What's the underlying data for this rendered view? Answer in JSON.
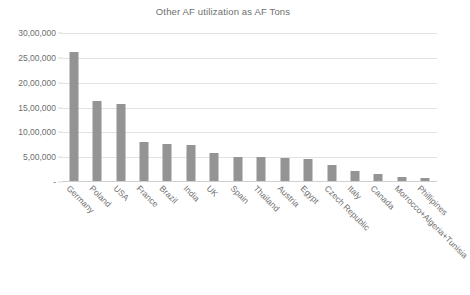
{
  "chart_data": {
    "type": "bar",
    "title": "Other AF utilization as AF Tons",
    "xlabel": "",
    "ylabel": "",
    "ylim": [
      0,
      3000000
    ],
    "grid": true,
    "legend": "none",
    "y_tick_labels": [
      "30,00,000",
      "25,00,000",
      "20,00,000",
      "15,00,000",
      "10,00,000",
      "5,00,000",
      "-"
    ],
    "y_tick_values": [
      3000000,
      2500000,
      2000000,
      1500000,
      1000000,
      500000,
      0
    ],
    "bar_color": "#949494",
    "categories": [
      "Germany",
      "Poland",
      "USA",
      "France",
      "Brazil",
      "India",
      "UK",
      "Spain",
      "Thailand",
      "Austria",
      "Egypt",
      "Czech Republic",
      "Italy",
      "Canada",
      "Morrocco+Algeria+Tunisia",
      "Phillipines"
    ],
    "values": [
      2620000,
      1630000,
      1580000,
      810000,
      760000,
      740000,
      580000,
      510000,
      500000,
      490000,
      470000,
      350000,
      220000,
      170000,
      100000,
      80000
    ]
  }
}
